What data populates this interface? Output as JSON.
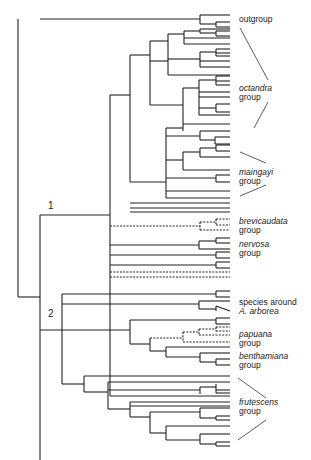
{
  "diagram": {
    "type": "phylogenetic-tree",
    "node_labels": [
      {
        "text": "1",
        "x": 48,
        "y": 200
      },
      {
        "text": "2",
        "x": 48,
        "y": 308
      }
    ],
    "groups": [
      {
        "name": "outgroup",
        "l1": "outgroup",
        "l2": "",
        "italic": false,
        "x": 239,
        "y": 15
      },
      {
        "name": "octandra",
        "l1": "octandra",
        "l2": "group",
        "italic": true,
        "x": 239,
        "y": 84
      },
      {
        "name": "maingayi",
        "l1": "maingayi",
        "l2": "group",
        "italic": true,
        "x": 239,
        "y": 168
      },
      {
        "name": "brevicaudata",
        "l1": "brevicaudata",
        "l2": "group",
        "italic": true,
        "x": 239,
        "y": 217
      },
      {
        "name": "nervosa",
        "l1": "nervosa",
        "l2": "group",
        "italic": true,
        "x": 239,
        "y": 240
      },
      {
        "name": "arborea",
        "l1": "species around",
        "l2": "A. arborea",
        "italic": false,
        "italic2": true,
        "x": 239,
        "y": 298
      },
      {
        "name": "papuana",
        "l1": "papuana",
        "l2": "group",
        "italic": true,
        "x": 239,
        "y": 330
      },
      {
        "name": "benthamiana",
        "l1": "benthamiana",
        "l2": "group",
        "italic": true,
        "x": 239,
        "y": 352
      },
      {
        "name": "frutescens",
        "l1": "frutescens",
        "l2": "group",
        "italic": true,
        "x": 239,
        "y": 398
      }
    ],
    "bracket_lines": [
      [
        240,
        28,
        268,
        80
      ],
      [
        268,
        102,
        254,
        128
      ],
      [
        240,
        152,
        266,
        163
      ],
      [
        266,
        185,
        240,
        196
      ],
      [
        238,
        378,
        266,
        398
      ],
      [
        266,
        420,
        238,
        440
      ]
    ],
    "solid": [
      [
        18,
        19,
        18,
        297
      ],
      [
        18,
        297,
        40,
        297
      ],
      [
        40,
        19,
        200,
        19
      ],
      [
        200,
        15,
        200,
        24
      ],
      [
        200,
        15,
        230,
        15
      ],
      [
        200,
        24,
        216,
        24
      ],
      [
        216,
        22,
        216,
        27
      ],
      [
        216,
        22,
        230,
        22
      ],
      [
        216,
        27,
        230,
        27
      ],
      [
        40,
        215,
        40,
        465
      ],
      [
        40,
        215,
        110,
        215
      ],
      [
        110,
        95,
        110,
        396
      ],
      [
        110,
        95,
        130,
        95
      ],
      [
        130,
        55,
        130,
        182
      ],
      [
        130,
        55,
        150,
        55
      ],
      [
        130,
        182,
        166,
        182
      ],
      [
        150,
        41,
        150,
        105
      ],
      [
        150,
        41,
        168,
        41
      ],
      [
        150,
        105,
        183,
        105
      ],
      [
        168,
        34,
        168,
        75
      ],
      [
        168,
        34,
        184,
        34
      ],
      [
        168,
        75,
        230,
        75
      ],
      [
        184,
        31,
        184,
        38
      ],
      [
        184,
        31,
        200,
        31
      ],
      [
        200,
        29,
        200,
        33
      ],
      [
        200,
        29,
        230,
        29
      ],
      [
        200,
        33,
        216,
        33
      ],
      [
        216,
        31,
        216,
        36
      ],
      [
        216,
        31,
        230,
        31
      ],
      [
        216,
        36,
        230,
        36
      ],
      [
        184,
        38,
        230,
        38
      ],
      [
        184,
        38,
        184,
        44
      ],
      [
        184,
        44,
        230,
        44
      ],
      [
        168,
        59,
        200,
        59
      ],
      [
        168,
        59,
        168,
        59
      ],
      [
        200,
        52,
        200,
        67
      ],
      [
        200,
        52,
        216,
        52
      ],
      [
        216,
        49,
        216,
        56
      ],
      [
        216,
        49,
        230,
        49
      ],
      [
        216,
        53,
        230,
        53
      ],
      [
        216,
        56,
        230,
        56
      ],
      [
        200,
        61,
        230,
        61
      ],
      [
        200,
        67,
        230,
        67
      ],
      [
        150,
        64,
        150,
        64
      ],
      [
        150,
        61,
        168,
        61
      ],
      [
        183,
        88,
        183,
        124
      ],
      [
        183,
        88,
        199,
        88
      ],
      [
        183,
        124,
        230,
        124
      ],
      [
        199,
        80,
        199,
        115
      ],
      [
        199,
        80,
        216,
        80
      ],
      [
        216,
        76,
        216,
        85
      ],
      [
        216,
        76,
        230,
        76
      ],
      [
        216,
        81,
        230,
        81
      ],
      [
        216,
        85,
        230,
        85
      ],
      [
        199,
        92,
        230,
        92
      ],
      [
        199,
        97,
        230,
        97
      ],
      [
        199,
        108,
        216,
        108
      ],
      [
        216,
        104,
        216,
        112
      ],
      [
        216,
        104,
        230,
        104
      ],
      [
        216,
        112,
        230,
        112
      ],
      [
        199,
        115,
        230,
        115
      ],
      [
        166,
        128,
        166,
        198
      ],
      [
        166,
        128,
        183,
        128
      ],
      [
        183,
        124,
        183,
        131
      ],
      [
        166,
        136,
        200,
        136
      ],
      [
        200,
        131,
        200,
        140
      ],
      [
        200,
        131,
        230,
        131
      ],
      [
        200,
        140,
        215,
        140
      ],
      [
        215,
        137,
        215,
        144
      ],
      [
        215,
        137,
        230,
        137
      ],
      [
        215,
        144,
        230,
        144
      ],
      [
        166,
        160,
        183,
        160
      ],
      [
        183,
        152,
        183,
        170
      ],
      [
        183,
        152,
        200,
        152
      ],
      [
        200,
        148,
        200,
        157
      ],
      [
        200,
        148,
        216,
        148
      ],
      [
        216,
        145,
        216,
        151
      ],
      [
        216,
        145,
        230,
        145
      ],
      [
        216,
        151,
        230,
        151
      ],
      [
        200,
        157,
        230,
        157
      ],
      [
        183,
        170,
        230,
        170
      ],
      [
        166,
        178,
        216,
        178
      ],
      [
        216,
        175,
        216,
        182
      ],
      [
        216,
        175,
        230,
        175
      ],
      [
        216,
        182,
        230,
        182
      ],
      [
        166,
        191,
        230,
        191
      ],
      [
        166,
        198,
        230,
        198
      ],
      [
        130,
        203,
        230,
        203
      ],
      [
        130,
        208,
        230,
        208
      ],
      [
        130,
        212,
        230,
        212
      ],
      [
        110,
        245,
        199,
        245
      ],
      [
        199,
        241,
        199,
        249
      ],
      [
        199,
        241,
        216,
        241
      ],
      [
        216,
        238,
        216,
        243
      ],
      [
        216,
        238,
        230,
        238
      ],
      [
        216,
        243,
        230,
        243
      ],
      [
        199,
        249,
        230,
        249
      ],
      [
        110,
        255,
        216,
        255
      ],
      [
        216,
        252,
        216,
        258
      ],
      [
        216,
        252,
        230,
        252
      ],
      [
        216,
        258,
        230,
        258
      ],
      [
        110,
        265,
        216,
        265
      ],
      [
        216,
        262,
        216,
        268
      ],
      [
        216,
        262,
        230,
        262
      ],
      [
        216,
        268,
        230,
        268
      ],
      [
        110,
        396,
        230,
        396
      ],
      [
        62,
        294,
        62,
        384
      ],
      [
        62,
        294,
        216,
        294
      ],
      [
        216,
        291,
        216,
        297
      ],
      [
        216,
        291,
        230,
        291
      ],
      [
        216,
        297,
        230,
        297
      ],
      [
        62,
        304,
        199,
        304
      ],
      [
        199,
        301,
        199,
        309
      ],
      [
        199,
        301,
        230,
        301
      ],
      [
        199,
        309,
        216,
        309
      ],
      [
        216,
        306,
        216,
        311
      ],
      [
        216,
        306,
        230,
        311
      ],
      [
        40,
        330,
        130,
        330
      ],
      [
        130,
        320,
        130,
        344
      ],
      [
        130,
        320,
        216,
        320
      ],
      [
        216,
        318,
        216,
        324
      ],
      [
        216,
        318,
        230,
        318
      ],
      [
        216,
        324,
        230,
        324
      ],
      [
        130,
        344,
        150,
        344
      ],
      [
        150,
        338,
        150,
        351
      ],
      [
        150,
        351,
        166,
        351
      ],
      [
        166,
        347,
        166,
        357
      ],
      [
        166,
        347,
        230,
        347
      ],
      [
        166,
        357,
        200,
        357
      ],
      [
        200,
        353,
        200,
        362
      ],
      [
        200,
        353,
        230,
        353
      ],
      [
        200,
        362,
        216,
        362
      ],
      [
        216,
        359,
        216,
        365
      ],
      [
        216,
        359,
        230,
        359
      ],
      [
        216,
        365,
        230,
        365
      ],
      [
        62,
        384,
        84,
        384
      ],
      [
        84,
        376,
        84,
        392
      ],
      [
        84,
        376,
        230,
        376
      ],
      [
        84,
        392,
        108,
        392
      ],
      [
        108,
        382,
        108,
        409
      ],
      [
        108,
        382,
        230,
        382
      ],
      [
        108,
        390,
        200,
        390
      ],
      [
        200,
        387,
        200,
        394
      ],
      [
        200,
        387,
        216,
        387
      ],
      [
        216,
        384,
        216,
        393
      ],
      [
        216,
        390,
        230,
        390
      ],
      [
        216,
        393,
        230,
        393
      ],
      [
        108,
        409,
        130,
        409
      ],
      [
        130,
        402,
        130,
        417
      ],
      [
        130,
        402,
        230,
        402
      ],
      [
        130,
        406,
        230,
        406
      ],
      [
        130,
        417,
        150,
        417
      ],
      [
        150,
        412,
        150,
        433
      ],
      [
        150,
        412,
        200,
        412
      ],
      [
        200,
        408,
        200,
        418
      ],
      [
        200,
        408,
        230,
        408
      ],
      [
        200,
        418,
        216,
        418
      ],
      [
        216,
        416,
        216,
        420
      ],
      [
        216,
        416,
        230,
        416
      ],
      [
        216,
        420,
        230,
        420
      ],
      [
        150,
        433,
        166,
        433
      ],
      [
        166,
        426,
        166,
        440
      ],
      [
        166,
        426,
        230,
        426
      ],
      [
        166,
        440,
        200,
        440
      ],
      [
        200,
        434,
        200,
        444
      ],
      [
        200,
        434,
        230,
        434
      ],
      [
        200,
        444,
        216,
        444
      ],
      [
        216,
        442,
        216,
        446
      ],
      [
        216,
        442,
        230,
        442
      ],
      [
        216,
        446,
        230,
        446
      ]
    ],
    "dashed": [
      [
        110,
        226,
        200,
        226
      ],
      [
        200,
        222,
        200,
        230
      ],
      [
        200,
        222,
        216,
        222
      ],
      [
        216,
        219,
        216,
        225
      ],
      [
        216,
        219,
        230,
        219
      ],
      [
        216,
        225,
        230,
        225
      ],
      [
        200,
        230,
        230,
        230
      ],
      [
        110,
        272,
        230,
        272
      ],
      [
        110,
        277,
        230,
        277
      ],
      [
        150,
        338,
        183,
        338
      ],
      [
        183,
        332,
        183,
        342
      ],
      [
        183,
        332,
        199,
        332
      ],
      [
        199,
        329,
        199,
        335
      ],
      [
        199,
        329,
        216,
        329
      ],
      [
        216,
        327,
        216,
        331
      ],
      [
        216,
        327,
        230,
        327
      ],
      [
        216,
        331,
        230,
        331
      ],
      [
        199,
        335,
        230,
        335
      ],
      [
        183,
        342,
        230,
        342
      ]
    ]
  }
}
